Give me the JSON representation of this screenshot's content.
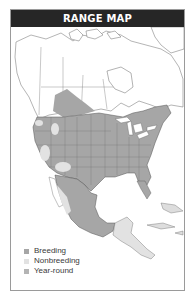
{
  "header": {
    "title": "RANGE MAP"
  },
  "colors": {
    "header_bg": "#262626",
    "breeding": "#a6a6a6",
    "nonbreeding": "#e2e2e2",
    "year_round": "#b4b4b4",
    "land": "#ffffff",
    "borders": "#555555"
  },
  "legend": {
    "items": [
      {
        "label": "Breeding",
        "color": "#a6a6a6"
      },
      {
        "label": "Nonbreeding",
        "color": "#e2e2e2"
      },
      {
        "label": "Year-round",
        "color": "#b4b4b4"
      }
    ]
  },
  "map": {
    "region": "North America (Canada, United States, Mexico, Central America, Caribbean)"
  }
}
